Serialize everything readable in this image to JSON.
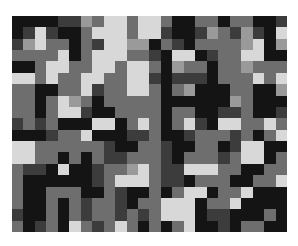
{
  "image": {
    "description": "Grayscale random pixel mosaic",
    "columns": 24,
    "rows": 19,
    "palette": {
      "0": "#141414",
      "1": "#3c3c3c",
      "2": "#6e6e6e",
      "3": "#9a9a9a",
      "4": "#d8d8d8"
    },
    "grid": [
      [
        0,
        0,
        0,
        0,
        1,
        1,
        3,
        2,
        4,
        4,
        2,
        4,
        4,
        2,
        0,
        0,
        2,
        2,
        0,
        2,
        2,
        0,
        0,
        1
      ],
      [
        0,
        1,
        4,
        1,
        0,
        0,
        2,
        4,
        4,
        4,
        2,
        4,
        4,
        1,
        0,
        0,
        1,
        3,
        2,
        1,
        3,
        1,
        0,
        4
      ],
      [
        1,
        3,
        4,
        2,
        2,
        0,
        2,
        1,
        4,
        4,
        3,
        3,
        0,
        2,
        1,
        0,
        2,
        2,
        2,
        2,
        3,
        4,
        0,
        3
      ],
      [
        2,
        2,
        2,
        2,
        4,
        0,
        2,
        4,
        4,
        4,
        2,
        2,
        1,
        0,
        4,
        4,
        0,
        1,
        2,
        2,
        4,
        4,
        0,
        0
      ],
      [
        0,
        0,
        2,
        4,
        4,
        2,
        2,
        4,
        4,
        2,
        4,
        4,
        2,
        0,
        3,
        2,
        2,
        0,
        2,
        2,
        3,
        2,
        2,
        2
      ],
      [
        4,
        4,
        2,
        4,
        2,
        2,
        4,
        4,
        2,
        2,
        4,
        4,
        1,
        0,
        1,
        1,
        1,
        0,
        2,
        2,
        2,
        4,
        2,
        4
      ],
      [
        2,
        2,
        0,
        0,
        2,
        2,
        4,
        1,
        2,
        2,
        4,
        4,
        2,
        0,
        2,
        3,
        0,
        0,
        0,
        2,
        2,
        0,
        0,
        3
      ],
      [
        2,
        2,
        0,
        2,
        4,
        3,
        2,
        0,
        2,
        2,
        2,
        2,
        2,
        0,
        0,
        0,
        0,
        0,
        0,
        3,
        2,
        0,
        0,
        0
      ],
      [
        2,
        2,
        0,
        2,
        4,
        4,
        1,
        0,
        0,
        2,
        2,
        2,
        2,
        0,
        2,
        2,
        0,
        0,
        1,
        1,
        2,
        0,
        0,
        1
      ],
      [
        1,
        2,
        1,
        2,
        0,
        0,
        0,
        4,
        4,
        0,
        2,
        4,
        2,
        0,
        2,
        4,
        1,
        0,
        4,
        4,
        2,
        2,
        4,
        2
      ],
      [
        0,
        0,
        0,
        1,
        2,
        2,
        4,
        0,
        0,
        0,
        1,
        1,
        2,
        0,
        0,
        1,
        2,
        2,
        2,
        1,
        2,
        0,
        2,
        4
      ],
      [
        4,
        4,
        2,
        2,
        2,
        2,
        2,
        2,
        1,
        0,
        0,
        2,
        2,
        1,
        0,
        0,
        2,
        2,
        0,
        1,
        4,
        4,
        0,
        0
      ],
      [
        4,
        4,
        2,
        2,
        0,
        2,
        0,
        2,
        1,
        1,
        2,
        2,
        2,
        1,
        0,
        2,
        2,
        2,
        1,
        2,
        4,
        4,
        0,
        2
      ],
      [
        2,
        1,
        1,
        0,
        4,
        0,
        0,
        1,
        2,
        2,
        3,
        4,
        2,
        1,
        1,
        4,
        4,
        4,
        2,
        2,
        0,
        0,
        2,
        2
      ],
      [
        2,
        0,
        0,
        0,
        0,
        0,
        0,
        1,
        2,
        4,
        4,
        4,
        2,
        1,
        1,
        0,
        2,
        2,
        2,
        0,
        0,
        2,
        2,
        4
      ],
      [
        2,
        0,
        0,
        2,
        2,
        2,
        0,
        0,
        2,
        1,
        0,
        0,
        2,
        0,
        2,
        4,
        4,
        0,
        2,
        2,
        4,
        0,
        0,
        0
      ],
      [
        2,
        0,
        0,
        2,
        0,
        2,
        1,
        2,
        2,
        1,
        0,
        2,
        2,
        4,
        4,
        4,
        0,
        2,
        2,
        4,
        0,
        0,
        0,
        0
      ],
      [
        1,
        0,
        0,
        2,
        0,
        2,
        1,
        2,
        2,
        1,
        2,
        1,
        2,
        4,
        4,
        4,
        0,
        1,
        1,
        0,
        0,
        0,
        2,
        0
      ],
      [
        2,
        0,
        1,
        2,
        0,
        4,
        2,
        1,
        2,
        4,
        2,
        0,
        2,
        0,
        2,
        4,
        0,
        0,
        1,
        0,
        2,
        2,
        0,
        0
      ]
    ]
  }
}
